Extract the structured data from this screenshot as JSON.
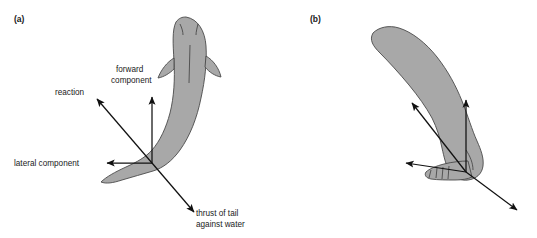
{
  "figure": {
    "caption_absent": true,
    "background_color": "#ffffff",
    "body_fill_color": "#a8a8a8",
    "body_outline_color": "#4a4a4a",
    "vector_color": "#111111",
    "panels": [
      {
        "id": "a",
        "label": "(a)",
        "subject": "fish-dorsal-view",
        "vectors": [
          {
            "name": "reaction",
            "label": "reaction",
            "direction": "upper-left",
            "origin": [
              152,
              163
            ],
            "tip": [
              95,
              97
            ]
          },
          {
            "name": "forward-component",
            "label": "forward component",
            "direction": "up",
            "origin": [
              152,
              163
            ],
            "tip": [
              152,
              95
            ]
          },
          {
            "name": "lateral-component",
            "label": "lateral component",
            "direction": "left",
            "origin": [
              152,
              163
            ],
            "tip": [
              105,
              163
            ]
          },
          {
            "name": "thrust-of-tail",
            "label": "thrust of tail against water",
            "direction": "lower-right",
            "origin": [
              152,
              163
            ],
            "tip": [
              196,
              214
            ]
          }
        ]
      },
      {
        "id": "b",
        "label": "(b)",
        "subject": "human-leg-and-foot",
        "vectors": [
          {
            "name": "reaction",
            "label": "",
            "direction": "upper-left",
            "origin": [
              466,
              172
            ],
            "tip": [
              410,
              101
            ]
          },
          {
            "name": "forward-component",
            "label": "",
            "direction": "up",
            "origin": [
              466,
              172
            ],
            "tip": [
              466,
              98
            ]
          },
          {
            "name": "lateral-component",
            "label": "",
            "direction": "left",
            "origin": [
              466,
              172
            ],
            "tip": [
              404,
              163
            ]
          },
          {
            "name": "thrust-of-foot",
            "label": "",
            "direction": "lower-right",
            "origin": [
              466,
              172
            ],
            "tip": [
              519,
              212
            ]
          }
        ]
      }
    ]
  },
  "labels": {
    "panel_a": "(a)",
    "panel_b": "(b)",
    "reaction": "reaction",
    "forward_component_line1": "forward",
    "forward_component_line2": "component",
    "lateral_component": "lateral component",
    "thrust_line1": "thrust of tail",
    "thrust_line2": "against water"
  }
}
